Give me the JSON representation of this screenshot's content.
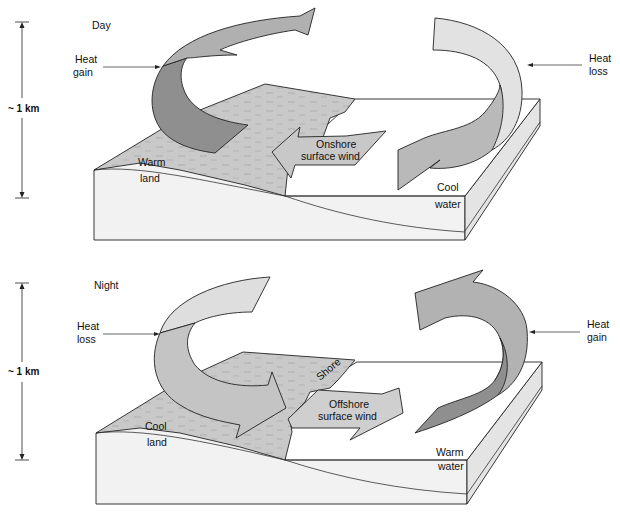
{
  "diagram": {
    "colors": {
      "land_surface": "#c9c9c9",
      "land_side": "#ececec",
      "water_top": "#ffffff",
      "water_side": "#f4f4f4",
      "arrow_dark": "#8f8f8f",
      "arrow_mid": "#b5b5b5",
      "arrow_light": "#dcdcdc",
      "outline": "#222222"
    },
    "panels": [
      {
        "id": "day",
        "title": "Day",
        "scale_label": "~ 1 km",
        "left_callout": [
          "Heat",
          "gain"
        ],
        "right_callout": [
          "Heat",
          "loss"
        ],
        "land_label": [
          "Warm",
          "land"
        ],
        "water_label": [
          "Cool",
          "water"
        ],
        "wind_label": [
          "Onshore",
          "surface wind"
        ]
      },
      {
        "id": "night",
        "title": "Night",
        "scale_label": "~ 1 km",
        "left_callout": [
          "Heat",
          "loss"
        ],
        "right_callout": [
          "Heat",
          "gain"
        ],
        "land_label": [
          "Cool",
          "land"
        ],
        "water_label": [
          "Warm",
          "water"
        ],
        "wind_label": [
          "Offshore",
          "surface wind"
        ],
        "shore_label": "Shore"
      }
    ]
  }
}
